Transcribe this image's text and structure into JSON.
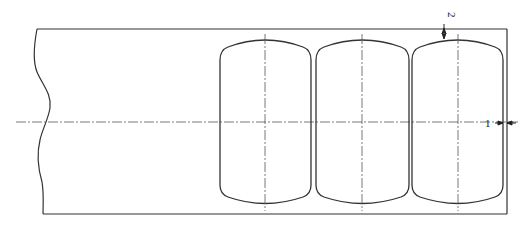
{
  "figure": {
    "type": "technical-drawing",
    "labels": {
      "dim_1": "1",
      "dim_2": "2"
    },
    "capsules": [
      {
        "id": "capsule-1",
        "left": 220,
        "right": 311,
        "center_x": 265
      },
      {
        "id": "capsule-2",
        "left": 316,
        "right": 409,
        "center_x": 362
      },
      {
        "id": "capsule-3",
        "left": 412,
        "right": 503,
        "center_x": 458
      }
    ],
    "colors": {
      "line": "#333333",
      "centerline": "#555555",
      "background": "#ffffff"
    }
  }
}
